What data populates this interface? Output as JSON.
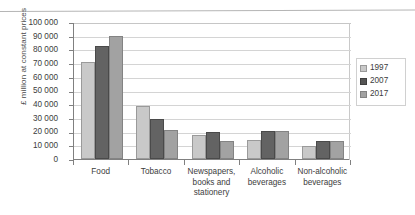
{
  "chart_data": {
    "type": "bar",
    "title": "",
    "xlabel": "",
    "ylabel": "£ million at constant prices",
    "ylim": [
      0,
      100000
    ],
    "grid": true,
    "legend_position": "right",
    "categories": [
      "Food",
      "Tobacco",
      "Newspapers, books and stationery",
      "Alcoholic beverages",
      "Non-alcoholic beverages"
    ],
    "category_labels": [
      [
        "Food"
      ],
      [
        "Tobacco"
      ],
      [
        "Newspapers,",
        "books and",
        "stationery"
      ],
      [
        "Alcoholic",
        "beverages"
      ],
      [
        "Non-alcoholic",
        "beverages"
      ]
    ],
    "series": [
      {
        "name": "1997",
        "color": "#c9c9c9",
        "values": [
          71000,
          39000,
          17500,
          14000,
          9500
        ]
      },
      {
        "name": "2007",
        "color": "#636363",
        "values": [
          82500,
          29000,
          19500,
          20500,
          13000
        ]
      },
      {
        "name": "2017",
        "color": "#a2a2a2",
        "values": [
          89500,
          21000,
          13000,
          20500,
          13500
        ]
      }
    ],
    "y_ticks": [
      {
        "value": 100000,
        "label": "100 000"
      },
      {
        "value": 90000,
        "label": "90 000"
      },
      {
        "value": 80000,
        "label": "80 000"
      },
      {
        "value": 70000,
        "label": "70 000"
      },
      {
        "value": 60000,
        "label": "60 000"
      },
      {
        "value": 50000,
        "label": "50 000"
      },
      {
        "value": 40000,
        "label": "40 000"
      },
      {
        "value": 30000,
        "label": "30 000"
      },
      {
        "value": 20000,
        "label": "20 000"
      },
      {
        "value": 10000,
        "label": "10 000"
      },
      {
        "value": 0,
        "label": "0"
      }
    ]
  },
  "legend": {
    "items": [
      {
        "label": "1997",
        "series_key": "s1997"
      },
      {
        "label": "2007",
        "series_key": "s2007"
      },
      {
        "label": "2017",
        "series_key": "s2017"
      }
    ]
  }
}
